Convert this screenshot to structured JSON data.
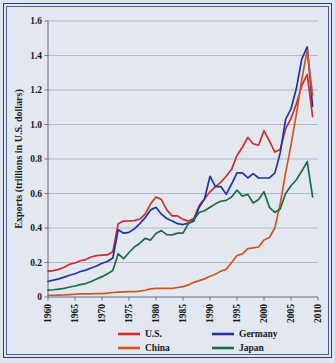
{
  "figure": {
    "background_color": "#e3e8f0",
    "frame_color": "#2b3d6b"
  },
  "chart_data": {
    "type": "line",
    "title": "",
    "xlabel": "",
    "ylabel": "Exports (trillions in U.S. dollars)",
    "xlim": [
      1960,
      2010
    ],
    "ylim": [
      0,
      1.6
    ],
    "grid": true,
    "legend_position": "bottom",
    "x_ticks": [
      "1960",
      "1965",
      "1970",
      "1975",
      "1980",
      "1985",
      "1990",
      "1995",
      "2000",
      "2005",
      "2010"
    ],
    "y_ticks": [
      "0",
      "0.2",
      "0.4",
      "0.6",
      "0.8",
      "1.0",
      "1.2",
      "1.4",
      "1.6"
    ],
    "x": [
      1960,
      1961,
      1962,
      1963,
      1964,
      1965,
      1966,
      1967,
      1968,
      1969,
      1970,
      1971,
      1972,
      1973,
      1974,
      1975,
      1976,
      1977,
      1978,
      1979,
      1980,
      1981,
      1982,
      1983,
      1984,
      1985,
      1986,
      1987,
      1988,
      1989,
      1990,
      1991,
      1992,
      1993,
      1994,
      1995,
      1996,
      1997,
      1998,
      1999,
      2000,
      2001,
      2002,
      2003,
      2004,
      2005,
      2006,
      2007,
      2008,
      2009
    ],
    "series": [
      {
        "name": "U.S.",
        "color": "#d32a2a",
        "values": [
          0.15,
          0.153,
          0.16,
          0.172,
          0.19,
          0.197,
          0.21,
          0.217,
          0.232,
          0.24,
          0.243,
          0.244,
          0.262,
          0.425,
          0.44,
          0.441,
          0.443,
          0.452,
          0.48,
          0.54,
          0.58,
          0.565,
          0.505,
          0.47,
          0.47,
          0.45,
          0.44,
          0.455,
          0.53,
          0.57,
          0.61,
          0.64,
          0.665,
          0.7,
          0.74,
          0.82,
          0.868,
          0.925,
          0.888,
          0.88,
          0.965,
          0.905,
          0.84,
          0.855,
          0.975,
          1.035,
          1.12,
          1.225,
          1.29,
          1.045
        ]
      },
      {
        "name": "Germany",
        "color": "#1c36a8",
        "values": [
          0.09,
          0.098,
          0.105,
          0.115,
          0.126,
          0.135,
          0.148,
          0.156,
          0.168,
          0.18,
          0.196,
          0.206,
          0.226,
          0.39,
          0.37,
          0.375,
          0.395,
          0.425,
          0.46,
          0.505,
          0.52,
          0.48,
          0.455,
          0.44,
          0.425,
          0.42,
          0.428,
          0.44,
          0.52,
          0.57,
          0.7,
          0.64,
          0.64,
          0.595,
          0.655,
          0.72,
          0.72,
          0.69,
          0.715,
          0.69,
          0.69,
          0.69,
          0.718,
          0.835,
          1.03,
          1.09,
          1.21,
          1.38,
          1.45,
          1.105
        ]
      },
      {
        "name": "China",
        "color": "#d4541f",
        "values": [
          0.01,
          0.01,
          0.011,
          0.012,
          0.014,
          0.016,
          0.018,
          0.018,
          0.018,
          0.019,
          0.02,
          0.022,
          0.026,
          0.028,
          0.03,
          0.031,
          0.031,
          0.034,
          0.039,
          0.047,
          0.05,
          0.05,
          0.05,
          0.05,
          0.055,
          0.06,
          0.07,
          0.085,
          0.095,
          0.105,
          0.12,
          0.132,
          0.15,
          0.16,
          0.2,
          0.24,
          0.25,
          0.28,
          0.285,
          0.29,
          0.33,
          0.345,
          0.4,
          0.54,
          0.72,
          0.88,
          1.06,
          1.26,
          1.43,
          1.17
        ]
      },
      {
        "name": "Japan",
        "color": "#1a6b46",
        "values": [
          0.04,
          0.042,
          0.046,
          0.05,
          0.058,
          0.064,
          0.072,
          0.078,
          0.09,
          0.104,
          0.118,
          0.134,
          0.154,
          0.25,
          0.222,
          0.258,
          0.29,
          0.312,
          0.34,
          0.33,
          0.368,
          0.385,
          0.362,
          0.36,
          0.37,
          0.37,
          0.425,
          0.45,
          0.49,
          0.5,
          0.52,
          0.54,
          0.555,
          0.56,
          0.58,
          0.62,
          0.585,
          0.595,
          0.545,
          0.565,
          0.61,
          0.52,
          0.49,
          0.51,
          0.6,
          0.645,
          0.68,
          0.73,
          0.785,
          0.58
        ]
      }
    ],
    "legend": [
      {
        "label": "U.S.",
        "color": "#d32a2a"
      },
      {
        "label": "Germany",
        "color": "#1c36a8"
      },
      {
        "label": "China",
        "color": "#d4541f"
      },
      {
        "label": "Japan",
        "color": "#1a6b46"
      }
    ]
  }
}
